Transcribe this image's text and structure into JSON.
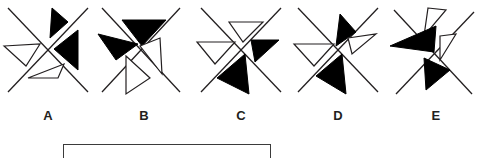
{
  "page": {
    "type": "visual-analogy-multiple-choice",
    "background_color": "#ffffff",
    "stroke_color": "#231f20",
    "fill_black": "#000000",
    "fill_white": "#ffffff"
  },
  "options": [
    {
      "id": "A",
      "label": "A",
      "x": 0,
      "cross": "X",
      "triangles": [
        {
          "position": "top",
          "fill": "black",
          "points": "52,8 68,22 50,38"
        },
        {
          "position": "left",
          "fill": "white",
          "points": "4,46 40,44 26,66"
        },
        {
          "position": "right",
          "fill": "black",
          "points": "78,30 78,70 54,49"
        },
        {
          "position": "bottom",
          "fill": "white",
          "points": "28,78 64,64 56,78"
        }
      ]
    },
    {
      "id": "B",
      "label": "B",
      "x": 96,
      "cross": "X",
      "triangles": [
        {
          "position": "top",
          "fill": "black",
          "points": "26,20 70,20 46,46"
        },
        {
          "position": "left",
          "fill": "black",
          "points": "2,34 40,44 20,60"
        },
        {
          "position": "right",
          "fill": "white",
          "points": "62,38 66,74 44,46"
        },
        {
          "position": "bottom",
          "fill": "white",
          "points": "30,56 52,78 30,94"
        }
      ]
    },
    {
      "id": "C",
      "label": "C",
      "x": 193,
      "cross": "X",
      "triangles": [
        {
          "position": "top",
          "fill": "white",
          "points": "36,20 70,20 50,40"
        },
        {
          "position": "left",
          "fill": "white",
          "points": "4,42 40,42 22,64"
        },
        {
          "position": "right",
          "fill": "black",
          "points": "58,40 86,40 62,62"
        },
        {
          "position": "bottom",
          "fill": "black",
          "points": "52,54 56,94 24,78"
        }
      ]
    },
    {
      "id": "D",
      "label": "D",
      "x": 290,
      "cross": "X",
      "triangles": [
        {
          "position": "top",
          "fill": "black",
          "points": "50,14 66,32 48,44"
        },
        {
          "position": "left",
          "fill": "white",
          "points": "4,44 42,44 24,66"
        },
        {
          "position": "right",
          "fill": "white",
          "points": "60,38 86,34 62,52"
        },
        {
          "position": "bottom",
          "fill": "black",
          "points": "52,56 56,94 26,76"
        }
      ]
    },
    {
      "id": "E",
      "label": "E",
      "x": 388,
      "cross": "X",
      "triangles": [
        {
          "position": "top",
          "fill": "white",
          "points": "42,10 56,10 38,34"
        },
        {
          "position": "left",
          "fill": "black",
          "points": "2,44 46,26 44,52"
        },
        {
          "position": "right",
          "fill": "white",
          "points": "52,38 66,36 50,60"
        },
        {
          "position": "bottom",
          "fill": "black",
          "points": "36,58 60,70 38,90"
        }
      ]
    }
  ],
  "answer_box": {
    "label": "answer-box",
    "value": "",
    "placeholder": ""
  }
}
